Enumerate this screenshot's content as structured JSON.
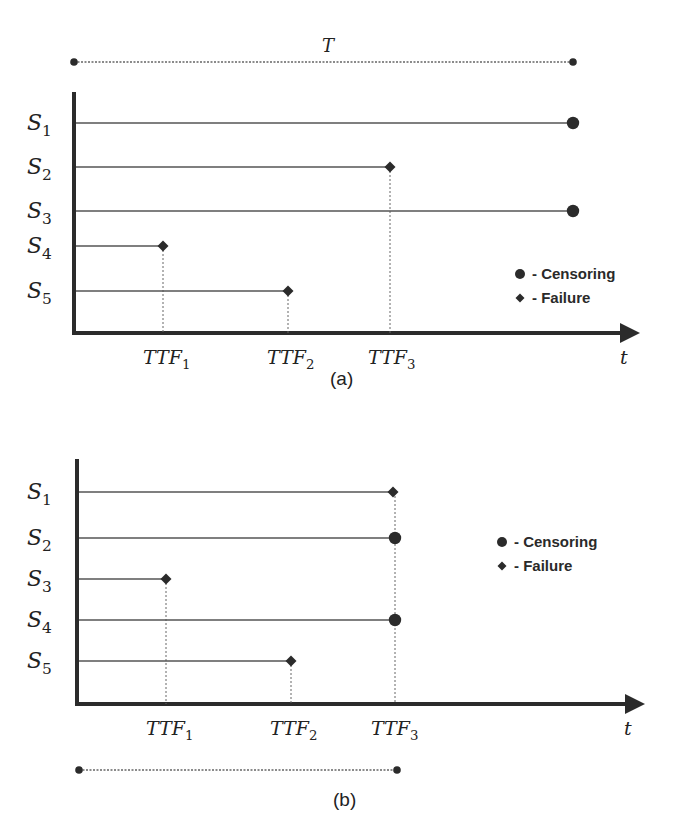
{
  "figure": {
    "colors": {
      "ink": "#2b2b2b",
      "line": "#555555",
      "dotted": "#666666",
      "background": "#ffffff"
    },
    "panels": [
      {
        "id": "a",
        "caption": "(a)",
        "caption_pos": [
          330,
          385
        ],
        "y_axis": {
          "x": 74,
          "y_top": 92,
          "y_bottom": 334
        },
        "x_axis": {
          "y": 333,
          "x_start": 72,
          "x_end": 640,
          "label": "t",
          "label_pos": [
            620,
            364
          ]
        },
        "span_bar": {
          "label": "T",
          "label_pos": [
            322,
            52
          ],
          "x1": 74,
          "x2": 573,
          "y": 62,
          "position": "top"
        },
        "units": [
          {
            "label": "S",
            "sub": "1",
            "y": 123,
            "end_x": 573,
            "event": "censoring"
          },
          {
            "label": "S",
            "sub": "2",
            "y": 167,
            "end_x": 390,
            "event": "failure"
          },
          {
            "label": "S",
            "sub": "3",
            "y": 211,
            "end_x": 573,
            "event": "censoring"
          },
          {
            "label": "S",
            "sub": "4",
            "y": 246,
            "end_x": 163,
            "event": "failure"
          },
          {
            "label": "S",
            "sub": "5",
            "y": 291,
            "end_x": 288,
            "event": "failure"
          }
        ],
        "ttf_markers": [
          {
            "label": "TTF",
            "sub": "1",
            "x": 163,
            "from_y": 246,
            "label_pos": [
              143,
              364
            ]
          },
          {
            "label": "TTF",
            "sub": "2",
            "x": 288,
            "from_y": 291,
            "label_pos": [
              267,
              364
            ]
          },
          {
            "label": "TTF",
            "sub": "3",
            "x": 390,
            "from_y": 167,
            "label_pos": [
              368,
              364
            ]
          }
        ],
        "legend": {
          "x": 520,
          "y": 274,
          "items": [
            {
              "symbol": "circle",
              "text": "- Censoring"
            },
            {
              "symbol": "diamond",
              "text": "- Failure"
            }
          ]
        }
      },
      {
        "id": "b",
        "caption": "(b)",
        "caption_pos": [
          333,
          806
        ],
        "y_axis": {
          "x": 77,
          "y_top": 459,
          "y_bottom": 706
        },
        "x_axis": {
          "y": 704,
          "x_start": 75,
          "x_end": 645,
          "label": "t",
          "label_pos": [
            624,
            735
          ]
        },
        "span_bar": {
          "label": "",
          "label_pos": [
            0,
            0
          ],
          "x1": 79,
          "x2": 397,
          "y": 770,
          "position": "bottom"
        },
        "units": [
          {
            "label": "S",
            "sub": "1",
            "y": 492,
            "end_x": 393,
            "event": "failure"
          },
          {
            "label": "S",
            "sub": "2",
            "y": 538,
            "end_x": 395,
            "event": "censoring"
          },
          {
            "label": "S",
            "sub": "3",
            "y": 579,
            "end_x": 166,
            "event": "failure"
          },
          {
            "label": "S",
            "sub": "4",
            "y": 620,
            "end_x": 395,
            "event": "censoring"
          },
          {
            "label": "S",
            "sub": "5",
            "y": 661,
            "end_x": 291,
            "event": "failure"
          }
        ],
        "ttf_markers": [
          {
            "label": "TTF",
            "sub": "1",
            "x": 166,
            "from_y": 579,
            "label_pos": [
              146,
              735
            ]
          },
          {
            "label": "TTF",
            "sub": "2",
            "x": 291,
            "from_y": 661,
            "label_pos": [
              270,
              735
            ]
          },
          {
            "label": "TTF",
            "sub": "3",
            "x": 395,
            "from_y": 492,
            "label_pos": [
              371,
              735
            ]
          }
        ],
        "legend": {
          "x": 502,
          "y": 542,
          "items": [
            {
              "symbol": "circle",
              "text": "- Censoring"
            },
            {
              "symbol": "diamond",
              "text": "- Failure"
            }
          ]
        }
      }
    ]
  }
}
